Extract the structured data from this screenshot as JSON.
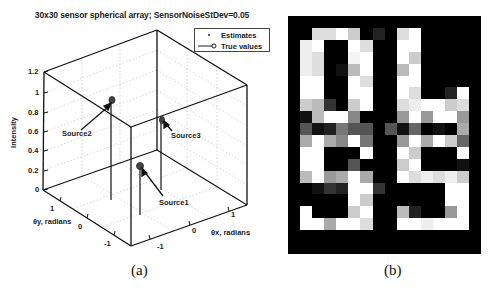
{
  "figure_a": {
    "caption": "(a)",
    "title": "30x30 sensor spherical array; SensorNoiseStDev=0.05",
    "legend": [
      {
        "label": "Estimates",
        "marker": "dot"
      },
      {
        "label": "True values",
        "marker": "line-circle"
      }
    ],
    "zlabel": "Intensity",
    "xlabel": "θx, radians",
    "ylabel": "θy, radians",
    "z_ticks": [
      "0",
      "0.2",
      "0.4",
      "0.6",
      "0.8",
      "1",
      "1.2"
    ],
    "x_ticks": [
      "-1",
      "0",
      "1"
    ],
    "y_ticks": [
      "1",
      "0",
      "-1"
    ],
    "sources": [
      {
        "label": "Source1"
      },
      {
        "label": "Source2"
      },
      {
        "label": "Source3"
      }
    ]
  },
  "figure_b": {
    "caption": "(b)",
    "description": "Pixelated grayscale image, 14x18 cells, showing characters '0', 'b' (top) and '8', '5' (bottom)"
  },
  "chart_data": [
    {
      "type": "scatter",
      "subtype": "3d-stem",
      "title": "30x30 sensor spherical array; SensorNoiseStDev=0.05",
      "xlabel": "θx, radians",
      "ylabel": "θy, radians",
      "zlabel": "Intensity",
      "xlim": [
        -1.5,
        1.5
      ],
      "ylim": [
        -1.5,
        1.5
      ],
      "zlim": [
        0,
        1.2
      ],
      "grid": true,
      "legend_position": "top-right",
      "legend": [
        "Estimates",
        "True values"
      ],
      "series": [
        {
          "name": "True values",
          "points": [
            {
              "label": "Source1",
              "x": 0.0,
              "y": -0.5,
              "z": 0.5
            },
            {
              "label": "Source2",
              "x": -0.7,
              "y": 0.5,
              "z": 1.0
            },
            {
              "label": "Source3",
              "x": 0.7,
              "y": 0.3,
              "z": 0.8
            }
          ]
        },
        {
          "name": "Estimates",
          "points": [
            {
              "label": "Source1",
              "x": 0.0,
              "y": -0.5,
              "z": 0.5
            },
            {
              "label": "Source2",
              "x": -0.7,
              "y": 0.5,
              "z": 1.0
            },
            {
              "label": "Source3",
              "x": 0.7,
              "y": 0.3,
              "z": 0.8
            }
          ]
        }
      ]
    },
    {
      "type": "heatmap",
      "title": "",
      "colormap": "gray",
      "rows": 18,
      "cols": 14,
      "values": [
        [
          0,
          221,
          221,
          255,
          204,
          0,
          34,
          0,
          221,
          255,
          0,
          0,
          0,
          0
        ],
        [
          238,
          255,
          0,
          0,
          255,
          221,
          0,
          0,
          255,
          255,
          0,
          0,
          0,
          0
        ],
        [
          238,
          221,
          0,
          0,
          244,
          255,
          0,
          0,
          255,
          204,
          0,
          0,
          0,
          0
        ],
        [
          238,
          221,
          0,
          17,
          187,
          255,
          0,
          0,
          187,
          255,
          0,
          0,
          0,
          0
        ],
        [
          255,
          255,
          0,
          0,
          255,
          221,
          0,
          0,
          255,
          255,
          0,
          0,
          0,
          0
        ],
        [
          255,
          255,
          0,
          0,
          255,
          255,
          0,
          0,
          255,
          221,
          0,
          0,
          34,
          255
        ],
        [
          204,
          187,
          51,
          0,
          204,
          255,
          0,
          0,
          221,
          238,
          255,
          255,
          204,
          221
        ],
        [
          17,
          187,
          255,
          255,
          136,
          0,
          0,
          0,
          153,
          255,
          153,
          255,
          255,
          153
        ],
        [
          85,
          17,
          34,
          119,
          85,
          85,
          0,
          85,
          17,
          102,
          0,
          17,
          0,
          170
        ],
        [
          170,
          255,
          170,
          136,
          255,
          119,
          0,
          0,
          153,
          255,
          170,
          255,
          204,
          102
        ],
        [
          255,
          255,
          0,
          0,
          0,
          255,
          0,
          0,
          255,
          204,
          0,
          0,
          0,
          255
        ],
        [
          255,
          255,
          0,
          0,
          85,
          0,
          0,
          0,
          204,
          255,
          0,
          0,
          0,
          17
        ],
        [
          187,
          255,
          153,
          170,
          255,
          170,
          0,
          0,
          255,
          221,
          238,
          221,
          238,
          204
        ],
        [
          0,
          17,
          51,
          34,
          255,
          255,
          51,
          0,
          0,
          0,
          0,
          0,
          255,
          255
        ],
        [
          0,
          0,
          0,
          0,
          255,
          204,
          0,
          0,
          0,
          0,
          0,
          0,
          255,
          255
        ],
        [
          255,
          0,
          0,
          0,
          204,
          255,
          0,
          0,
          187,
          34,
          0,
          0,
          153,
          255
        ],
        [
          255,
          255,
          170,
          255,
          255,
          221,
          0,
          0,
          255,
          255,
          238,
          255,
          255,
          255
        ],
        [
          0,
          0,
          0,
          0,
          0,
          0,
          0,
          0,
          0,
          0,
          0,
          0,
          0,
          0
        ]
      ]
    }
  ]
}
